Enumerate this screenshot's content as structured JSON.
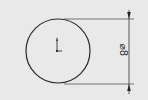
{
  "sketch": {
    "background": "#e9e9e9",
    "line_color": "#2a2a2a",
    "circle": {
      "cx": 58,
      "cy": 51,
      "r": 32
    },
    "dimension": {
      "label": "⌀8",
      "type": "diameter",
      "orientation": "vertical"
    },
    "origin_marker": "origin-axis-icon"
  }
}
